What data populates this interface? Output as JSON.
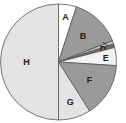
{
  "chart_data": {
    "type": "pie",
    "title": "",
    "start_angle_deg": 0,
    "direction": "clockwise",
    "categories": [
      "A",
      "B",
      "C",
      "D",
      "E",
      "F",
      "G",
      "H"
    ],
    "values": [
      5,
      14,
      1,
      1,
      5,
      15,
      9,
      50
    ],
    "unit": "percent (estimated)",
    "colors": [
      "#ffffff",
      "#9a9a9a",
      "#bfbfbf",
      "#6f6f6f",
      "#f2f2f2",
      "#9a9a9a",
      "#e3e3e3",
      "#e3e3e3"
    ],
    "labels": [
      "A",
      "B",
      "",
      "D",
      "E",
      "F",
      "G",
      "H"
    ],
    "annotations": [
      {
        "label": "D",
        "pointer": "leader line to thin slice"
      }
    ],
    "legend": "none"
  }
}
